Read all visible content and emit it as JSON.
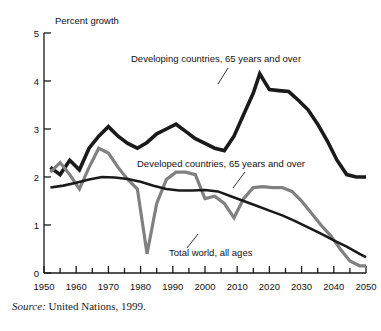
{
  "chart_data": {
    "type": "line",
    "title": "",
    "ylabel": "Percent growth",
    "xlabel": "",
    "xlim": [
      1950,
      2050
    ],
    "ylim": [
      0,
      5
    ],
    "y_ticks": [
      "0",
      "1",
      "2",
      "3",
      "4",
      "5"
    ],
    "x_ticks": [
      "1950",
      "1960",
      "1970",
      "1980",
      "1990",
      "2000",
      "2010",
      "2020",
      "2030",
      "2040",
      "2050"
    ],
    "x_minor_tick_step": 5,
    "grid": false,
    "legend_position": "inline-annotations",
    "colors": {
      "developing": "#1a1a1a",
      "developed": "#808080",
      "total_world": "#1a1a1a"
    },
    "series": [
      {
        "name": "Developing countries, 65 years and over",
        "color": "#1a1a1a",
        "width": 3.6,
        "x": [
          1952,
          1955,
          1958,
          1961,
          1964,
          1967,
          1970,
          1973,
          1976,
          1979,
          1982,
          1985,
          1988,
          1991,
          1994,
          1997,
          2000,
          2003,
          2006,
          2009,
          2012,
          2015,
          2017,
          2020,
          2023,
          2026,
          2029,
          2032,
          2035,
          2038,
          2041,
          2044,
          2047,
          2050
        ],
        "values": [
          2.2,
          2.05,
          2.35,
          2.15,
          2.6,
          2.85,
          3.05,
          2.85,
          2.7,
          2.6,
          2.72,
          2.9,
          3.0,
          3.1,
          2.95,
          2.8,
          2.7,
          2.6,
          2.55,
          2.85,
          3.3,
          3.75,
          4.15,
          3.82,
          3.8,
          3.78,
          3.6,
          3.4,
          3.1,
          2.75,
          2.35,
          2.05,
          2.0,
          2.0
        ]
      },
      {
        "name": "Developed countries, 65 years and over",
        "color": "#808080",
        "width": 3.2,
        "x": [
          1952,
          1955,
          1958,
          1961,
          1964,
          1967,
          1970,
          1973,
          1976,
          1979,
          1982,
          1985,
          1988,
          1991,
          1994,
          1997,
          2000,
          2003,
          2006,
          2009,
          2012,
          2015,
          2018,
          2021,
          2024,
          2027,
          2030,
          2033,
          2036,
          2039,
          2042,
          2045,
          2048,
          2050
        ],
        "values": [
          2.1,
          2.3,
          2.05,
          1.75,
          2.2,
          2.6,
          2.5,
          2.2,
          1.95,
          1.75,
          0.4,
          1.45,
          1.95,
          2.1,
          2.1,
          2.05,
          1.55,
          1.6,
          1.45,
          1.15,
          1.55,
          1.78,
          1.8,
          1.78,
          1.78,
          1.7,
          1.5,
          1.25,
          1.0,
          0.78,
          0.5,
          0.25,
          0.15,
          0.15
        ]
      },
      {
        "name": "Total world, all ages",
        "color": "#1a1a1a",
        "width": 2.6,
        "x": [
          1952,
          1956,
          1960,
          1964,
          1968,
          1972,
          1976,
          1980,
          1984,
          1988,
          1992,
          1996,
          2000,
          2004,
          2008,
          2012,
          2016,
          2020,
          2024,
          2028,
          2032,
          2036,
          2040,
          2044,
          2048,
          2050
        ],
        "values": [
          1.78,
          1.82,
          1.88,
          1.95,
          2.0,
          1.99,
          1.96,
          1.9,
          1.82,
          1.75,
          1.72,
          1.72,
          1.73,
          1.7,
          1.6,
          1.5,
          1.4,
          1.3,
          1.2,
          1.08,
          0.95,
          0.82,
          0.68,
          0.55,
          0.4,
          0.33
        ]
      }
    ],
    "annotations": [
      {
        "id": "developing-label",
        "text": "Developing countries, 65 years and over",
        "x": 131,
        "y": 62,
        "leader": {
          "x1": 228,
          "y1": 68,
          "x2": 218,
          "y2": 84
        }
      },
      {
        "id": "developed-label",
        "text": "Developed countries, 65 years and over",
        "x": 137,
        "y": 167,
        "leader": {
          "x1": 245,
          "y1": 172,
          "x2": 233,
          "y2": 188
        }
      },
      {
        "id": "total-world-label",
        "text": "Total world, all ages",
        "x": 169,
        "y": 256,
        "leader": {
          "x1": 187,
          "y1": 248,
          "x2": 198,
          "y2": 234
        }
      }
    ]
  },
  "source": {
    "prefix": "Source:",
    "text": "United Nations, 1999."
  }
}
